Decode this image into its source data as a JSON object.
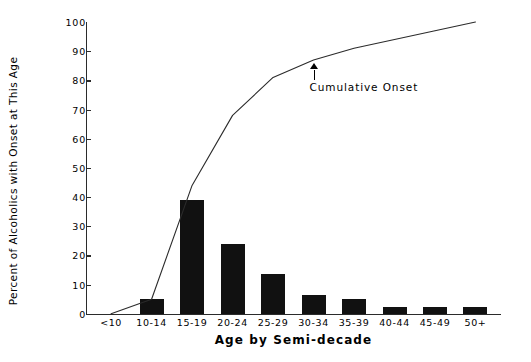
{
  "chart_data": {
    "type": "bar",
    "title": "",
    "xlabel": "Age by Semi-decade",
    "ylabel": "Percent of Alcoholics with Onset at This Age",
    "categories": [
      "<10",
      "10-14",
      "15-19",
      "20-24",
      "25-29",
      "30-34",
      "35-39",
      "40-44",
      "45-49",
      "50+"
    ],
    "values": [
      0,
      5,
      39,
      24,
      13.5,
      6.5,
      5,
      2.5,
      2.5,
      2.5
    ],
    "series": [
      {
        "name": "Onset at This Age",
        "type": "bar",
        "values": [
          0,
          5,
          39,
          24,
          13.5,
          6.5,
          5,
          2.5,
          2.5,
          2.5
        ]
      },
      {
        "name": "Cumulative Onset",
        "type": "line",
        "values": [
          0,
          5,
          44,
          68,
          81,
          87,
          91,
          94,
          97,
          100
        ]
      }
    ],
    "ylim": [
      0,
      100
    ],
    "yticks": [
      0,
      10,
      20,
      30,
      40,
      50,
      60,
      70,
      80,
      90,
      100
    ],
    "ytick_labels": [
      "0",
      "10",
      "20",
      "30",
      "40",
      "50",
      "60",
      "70",
      "80",
      "90",
      "100"
    ],
    "grid": false,
    "legend": "none",
    "annotations": [
      {
        "label": "Cumulative Onset",
        "points_to_series": "Cumulative Onset",
        "points_to_category": "30-34"
      }
    ],
    "colors": {
      "bar": "#111111",
      "line": "#2b2b2b",
      "axis": "#2b2b2b",
      "text": "#000000",
      "background": "#ffffff"
    }
  }
}
